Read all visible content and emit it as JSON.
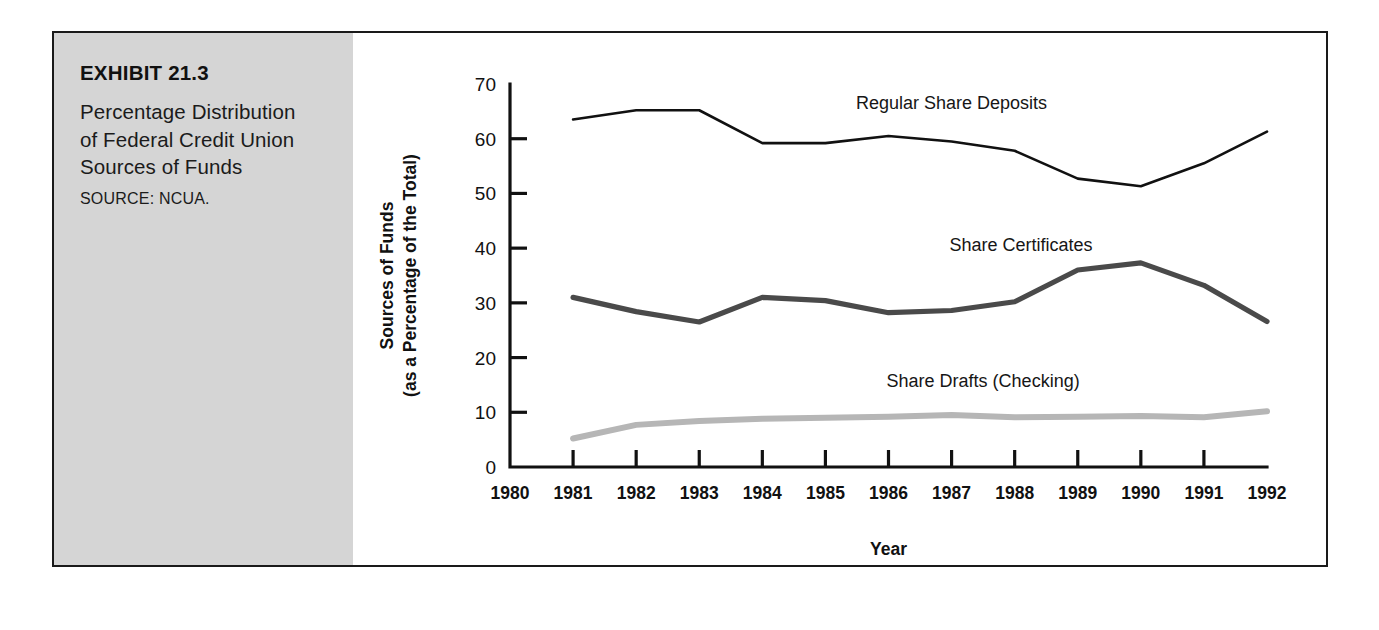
{
  "exhibit": {
    "number": "EXHIBIT 21.3",
    "title": "Percentage Distribution of Federal Credit Union Sources of Funds",
    "source": "SOURCE: NCUA.",
    "panel_bg": "#d5d5d5"
  },
  "chart_data": {
    "type": "line",
    "title": "",
    "xlabel": "Year",
    "ylabel": "Sources of Funds (as a Percentage of the Total)",
    "ylabel_line1": "Sources of Funds",
    "ylabel_line2": "(as a Percentage of the Total)",
    "x": [
      1981,
      1982,
      1983,
      1984,
      1985,
      1986,
      1987,
      1988,
      1989,
      1990,
      1991,
      1992
    ],
    "xtick_labels": [
      "1980",
      "1981",
      "1982",
      "1983",
      "1984",
      "1985",
      "1986",
      "1987",
      "1988",
      "1989",
      "1990",
      "1991",
      "1992"
    ],
    "xlim": [
      1980,
      1992
    ],
    "ytick_labels": [
      "0",
      "10",
      "20",
      "30",
      "40",
      "50",
      "60",
      "70"
    ],
    "yticks": [
      0,
      10,
      20,
      30,
      40,
      50,
      60,
      70
    ],
    "ylim": [
      0,
      70
    ],
    "grid": false,
    "legend": "inline-annotations",
    "series": [
      {
        "name": "Regular Share Deposits",
        "color": "#111111",
        "width": 2.6,
        "label_x": 1987.0,
        "label_y": 65.5,
        "values": [
          63.5,
          65.2,
          65.2,
          59.2,
          59.2,
          60.5,
          59.5,
          57.8,
          52.7,
          51.3,
          55.5,
          61.3
        ]
      },
      {
        "name": "Share Certificates",
        "color": "#4a4a4a",
        "width": 5.2,
        "label_x": 1988.1,
        "label_y": 39.5,
        "values": [
          31.0,
          28.4,
          26.5,
          31.0,
          30.4,
          28.2,
          28.6,
          30.2,
          36.0,
          37.3,
          33.2,
          26.6
        ]
      },
      {
        "name": "Share Drafts (Checking)",
        "color": "#b6b6b6",
        "width": 6.0,
        "label_x": 1987.5,
        "label_y": 14.6,
        "values": [
          5.2,
          7.7,
          8.4,
          8.8,
          9.0,
          9.2,
          9.5,
          9.1,
          9.2,
          9.3,
          9.1,
          10.2
        ]
      }
    ]
  }
}
